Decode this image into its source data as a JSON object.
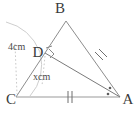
{
  "figure": {
    "background_color": "#ffffff",
    "line_color": "#8d8d8d",
    "label_color": "#3b3b3b",
    "guide_color": "#c2c2c2",
    "vertices": {
      "A": {
        "label": "A",
        "x": 120,
        "y": 97
      },
      "B": {
        "label": "B",
        "x": 66,
        "y": 21
      },
      "C": {
        "label": "C",
        "x": 16,
        "y": 97
      },
      "D": {
        "label": "D",
        "x": 45,
        "y": 53
      }
    },
    "labels": {
      "a": "A",
      "b": "B",
      "c": "C",
      "d": "D"
    },
    "measurements": {
      "segment_cd": "4cm",
      "segment_da": "xcm"
    },
    "marks": {
      "right_angle_at_d": "right-angle",
      "equal_sides_ticks": "double-tick",
      "equal_angles_at_a": "dot-dot"
    }
  }
}
